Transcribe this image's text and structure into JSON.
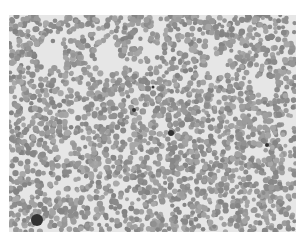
{
  "image": {
    "subject": "blood smear micrograph",
    "style": "grayscale",
    "background_color": "#ffffff",
    "cell_color": "#9a9a9a",
    "plasma_color": "#e6e6e6",
    "dark_spot_color": "#333333",
    "bounds": {
      "x": 9,
      "y": 15,
      "width": 287,
      "height": 217
    },
    "clear_regions": [
      {
        "cx": 40,
        "cy": 40,
        "r": 14
      },
      {
        "cx": 100,
        "cy": 43,
        "r": 12
      },
      {
        "cx": 207,
        "cy": 50,
        "r": 11
      },
      {
        "cx": 255,
        "cy": 68,
        "r": 9
      },
      {
        "cx": 140,
        "cy": 35,
        "r": 8
      }
    ],
    "dark_spots": [
      {
        "cx": 28,
        "cy": 205,
        "r": 6
      },
      {
        "cx": 162,
        "cy": 118,
        "r": 3
      },
      {
        "cx": 125,
        "cy": 95,
        "r": 2
      },
      {
        "cx": 258,
        "cy": 130,
        "r": 2
      },
      {
        "cx": 144,
        "cy": 72,
        "r": 1.5
      }
    ]
  }
}
